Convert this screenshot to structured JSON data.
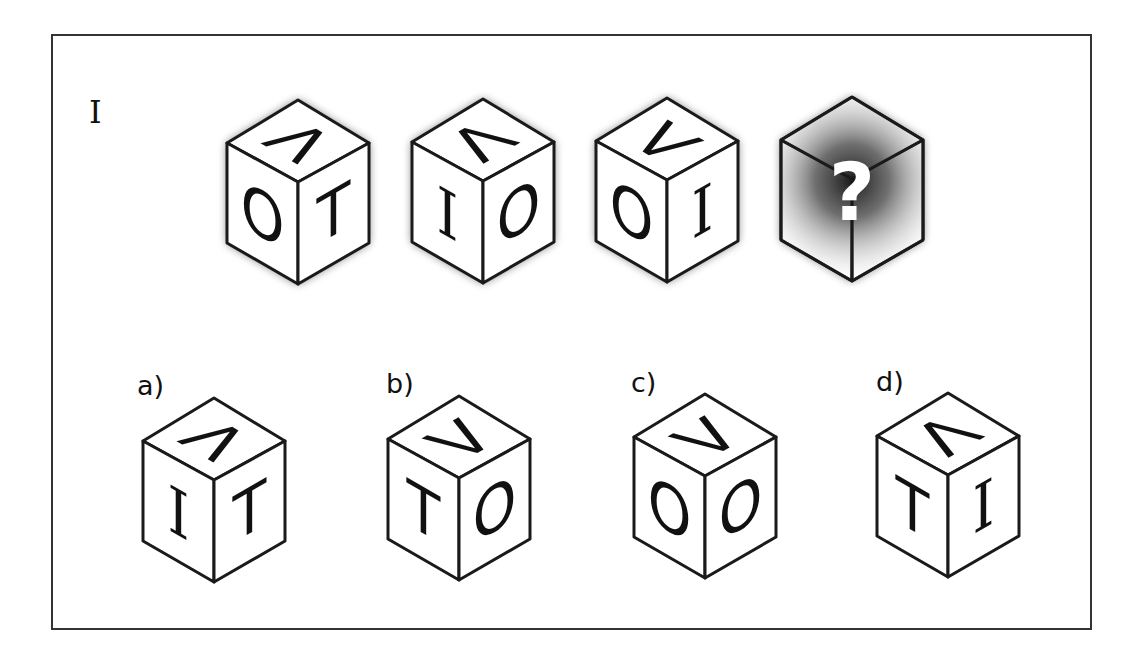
{
  "puzzle": {
    "row_label": "I",
    "question_mark": "?",
    "colors": {
      "stroke": "#1a1a1a",
      "face": "#ffffff",
      "shadow": "#000000",
      "frame": "#333333"
    },
    "sequence": [
      {
        "id": "seq-1",
        "x": 298,
        "y": 100,
        "left": "O",
        "right": "T",
        "top": "Λ",
        "top_rotation": 90,
        "shadow": true
      },
      {
        "id": "seq-2",
        "x": 483,
        "y": 99,
        "left": "I",
        "right": "O",
        "top": "Λ",
        "top_rotation": 0,
        "shadow": true
      },
      {
        "id": "seq-3",
        "x": 667,
        "y": 98,
        "left": "O",
        "right": "I",
        "top": "Λ",
        "top_rotation": -90,
        "shadow": true
      },
      {
        "id": "seq-4",
        "x": 852,
        "y": 97,
        "unknown": true,
        "shadow": true
      }
    ],
    "options": [
      {
        "label": "a)",
        "x": 214,
        "y": 398,
        "left": "I",
        "right": "T",
        "top": "Λ",
        "top_rotation": 90
      },
      {
        "label": "b)",
        "x": 459,
        "y": 396,
        "left": "T",
        "right": "O",
        "top": "Λ",
        "top_rotation": 180
      },
      {
        "label": "c)",
        "x": 705,
        "y": 394,
        "left": "O",
        "right": "O",
        "top": "Λ",
        "top_rotation": 180
      },
      {
        "label": "d)",
        "x": 948,
        "y": 393,
        "left": "T",
        "right": "I",
        "top": "Λ",
        "top_rotation": 0
      }
    ]
  }
}
